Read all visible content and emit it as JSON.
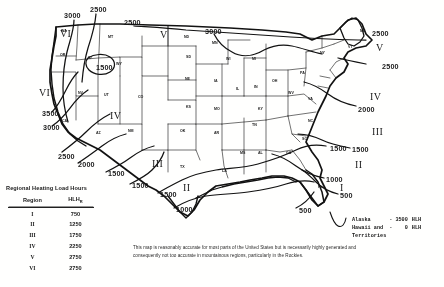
{
  "legend": {
    "title": "Regional Heating Load Hours",
    "columns": [
      "Region",
      "HLH"
    ],
    "column_sub": "R",
    "rows": [
      {
        "region": "I",
        "hlh": "750"
      },
      {
        "region": "II",
        "hlh": "1250"
      },
      {
        "region": "III",
        "hlh": "1750"
      },
      {
        "region": "IV",
        "hlh": "2250"
      },
      {
        "region": "V",
        "hlh": "2750"
      },
      {
        "region": "VI",
        "hlh": "2750"
      }
    ]
  },
  "disclaimer": "This map is reasonably accurate for most parts of the United States but is necessarily highly generated and consequently not too accurate in mountainous regions, particularly in the Rockies.",
  "ak_hi_note": {
    "rows": [
      {
        "place": "Alaska",
        "dash": "-",
        "value": "3500",
        "unit": "HLH"
      },
      {
        "place": "Hawaii and",
        "dash": "-",
        "value": "0",
        "unit": "HLH"
      },
      {
        "place": "Territories",
        "dash": "",
        "value": "",
        "unit": ""
      }
    ]
  },
  "chart_data": {
    "type": "map",
    "title": "Regional Heating Load Hours",
    "units": "HLH",
    "contour_levels": [
      500,
      1000,
      1500,
      2000,
      2500,
      3000,
      3500
    ],
    "regions": [
      {
        "label": "I",
        "hlh": 750
      },
      {
        "label": "II",
        "hlh": 1250
      },
      {
        "label": "III",
        "hlh": 1750
      },
      {
        "label": "IV",
        "hlh": 2250
      },
      {
        "label": "V",
        "hlh": 2750
      },
      {
        "label": "VI",
        "hlh": 2750
      }
    ],
    "offmap_values": [
      {
        "name": "Alaska",
        "hlh": 3500
      },
      {
        "name": "Hawaii and Territories",
        "hlh": 0
      }
    ]
  },
  "map": {
    "contour_labels": [
      {
        "text": "3000",
        "x": 64,
        "y": 12
      },
      {
        "text": "2500",
        "x": 90,
        "y": 6
      },
      {
        "text": "2500",
        "x": 124,
        "y": 19
      },
      {
        "text": "3000",
        "x": 205,
        "y": 28
      },
      {
        "text": "2500",
        "x": 372,
        "y": 30
      },
      {
        "text": "2500",
        "x": 382,
        "y": 63
      },
      {
        "text": "2000",
        "x": 358,
        "y": 106
      },
      {
        "text": "1500",
        "x": 352,
        "y": 146
      },
      {
        "text": "1500",
        "x": 330,
        "y": 145
      },
      {
        "text": "1000",
        "x": 326,
        "y": 176
      },
      {
        "text": "500",
        "x": 340,
        "y": 192
      },
      {
        "text": "500",
        "x": 299,
        "y": 207
      },
      {
        "text": "1000",
        "x": 176,
        "y": 206
      },
      {
        "text": "1500",
        "x": 160,
        "y": 191
      },
      {
        "text": "1500",
        "x": 132,
        "y": 182
      },
      {
        "text": "1500",
        "x": 96,
        "y": 64
      },
      {
        "text": "3500",
        "x": 42,
        "y": 110
      },
      {
        "text": "3000",
        "x": 43,
        "y": 124
      },
      {
        "text": "2500",
        "x": 58,
        "y": 153
      },
      {
        "text": "2000",
        "x": 78,
        "y": 161
      },
      {
        "text": "1500",
        "x": 108,
        "y": 170
      }
    ],
    "region_labels": [
      {
        "text": "VI",
        "x": 60,
        "y": 29
      },
      {
        "text": "V",
        "x": 160,
        "y": 30
      },
      {
        "text": "V",
        "x": 376,
        "y": 43
      },
      {
        "text": "VI",
        "x": 39,
        "y": 88
      },
      {
        "text": "IV",
        "x": 110,
        "y": 111
      },
      {
        "text": "IV",
        "x": 370,
        "y": 92
      },
      {
        "text": "III",
        "x": 372,
        "y": 127
      },
      {
        "text": "III",
        "x": 152,
        "y": 159
      },
      {
        "text": "II",
        "x": 355,
        "y": 160
      },
      {
        "text": "II",
        "x": 183,
        "y": 183
      },
      {
        "text": "I",
        "x": 340,
        "y": 183
      }
    ],
    "state_labels": [
      {
        "text": "WA",
        "x": 61,
        "y": 30
      },
      {
        "text": "MT",
        "x": 108,
        "y": 36
      },
      {
        "text": "ND",
        "x": 184,
        "y": 36
      },
      {
        "text": "MN",
        "x": 212,
        "y": 42
      },
      {
        "text": "OR",
        "x": 60,
        "y": 54
      },
      {
        "text": "ID",
        "x": 88,
        "y": 57
      },
      {
        "text": "WY",
        "x": 116,
        "y": 63
      },
      {
        "text": "SD",
        "x": 186,
        "y": 56
      },
      {
        "text": "WI",
        "x": 226,
        "y": 58
      },
      {
        "text": "MI",
        "x": 252,
        "y": 58
      },
      {
        "text": "NY",
        "x": 320,
        "y": 52
      },
      {
        "text": "ME",
        "x": 360,
        "y": 30
      },
      {
        "text": "VT",
        "x": 348,
        "y": 46
      },
      {
        "text": "NV",
        "x": 78,
        "y": 92
      },
      {
        "text": "UT",
        "x": 104,
        "y": 94
      },
      {
        "text": "CO",
        "x": 138,
        "y": 96
      },
      {
        "text": "NE",
        "x": 185,
        "y": 78
      },
      {
        "text": "IA",
        "x": 214,
        "y": 80
      },
      {
        "text": "IL",
        "x": 236,
        "y": 88
      },
      {
        "text": "IN",
        "x": 254,
        "y": 86
      },
      {
        "text": "OH",
        "x": 272,
        "y": 80
      },
      {
        "text": "PA",
        "x": 300,
        "y": 72
      },
      {
        "text": "CA",
        "x": 62,
        "y": 120
      },
      {
        "text": "AZ",
        "x": 96,
        "y": 132
      },
      {
        "text": "NM",
        "x": 128,
        "y": 130
      },
      {
        "text": "KS",
        "x": 186,
        "y": 106
      },
      {
        "text": "MO",
        "x": 214,
        "y": 108
      },
      {
        "text": "KY",
        "x": 258,
        "y": 108
      },
      {
        "text": "WV",
        "x": 288,
        "y": 92
      },
      {
        "text": "VA",
        "x": 308,
        "y": 98
      },
      {
        "text": "OK",
        "x": 180,
        "y": 130
      },
      {
        "text": "AR",
        "x": 214,
        "y": 132
      },
      {
        "text": "TN",
        "x": 252,
        "y": 124
      },
      {
        "text": "NC",
        "x": 308,
        "y": 120
      },
      {
        "text": "SC",
        "x": 302,
        "y": 138
      },
      {
        "text": "TX",
        "x": 180,
        "y": 166
      },
      {
        "text": "LA",
        "x": 222,
        "y": 170
      },
      {
        "text": "MS",
        "x": 240,
        "y": 152
      },
      {
        "text": "AL",
        "x": 258,
        "y": 152
      },
      {
        "text": "GA",
        "x": 286,
        "y": 152
      },
      {
        "text": "FL",
        "x": 318,
        "y": 186
      }
    ]
  }
}
